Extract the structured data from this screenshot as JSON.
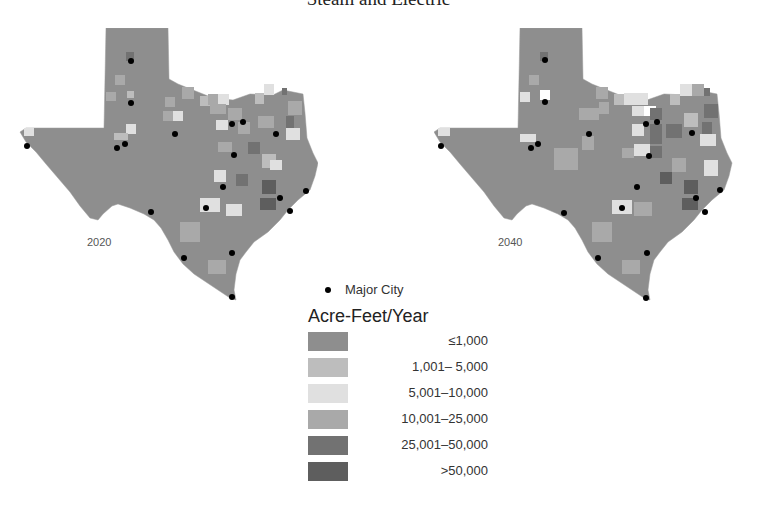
{
  "title": "Steam and Electric",
  "maps": [
    {
      "year": "2020"
    },
    {
      "year": "2040"
    }
  ],
  "legend": {
    "city_label": "Major City",
    "title": "Acre-Feet/Year",
    "classes": [
      {
        "label": "≤1,000",
        "color": "#8e8e8e"
      },
      {
        "label": "1,001–  5,000",
        "color": "#bdbdbd"
      },
      {
        "label": "5,001–10,000",
        "color": "#e0e0e0"
      },
      {
        "label": "10,001–25,000",
        "color": "#a9a9a9"
      },
      {
        "label": "25,001–50,000",
        "color": "#727272"
      },
      {
        "label": ">50,000",
        "color": "#5e5e5e"
      }
    ]
  }
}
